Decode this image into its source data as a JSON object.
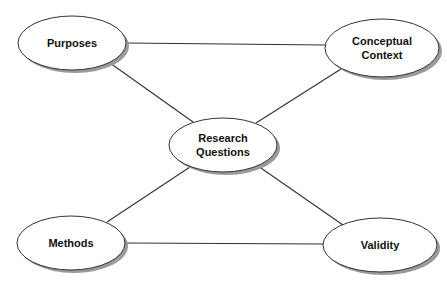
{
  "diagram": {
    "type": "concept-map",
    "colors": {
      "background": "#ffffff",
      "node_fill": "#ffffff",
      "node_stroke": "#333333",
      "shadow": "#9a9a9a",
      "edge": "#333333",
      "text": "#111111"
    },
    "nodes": [
      {
        "id": "purposes",
        "lines": [
          "Purposes"
        ],
        "cx": 72,
        "cy": 43,
        "rx": 54,
        "ry": 27
      },
      {
        "id": "conceptual-context",
        "lines": [
          "Conceptual",
          "Context"
        ],
        "cx": 382,
        "cy": 48,
        "rx": 57,
        "ry": 29
      },
      {
        "id": "research-questions",
        "lines": [
          "Research",
          "Questions"
        ],
        "cx": 223,
        "cy": 145,
        "rx": 54,
        "ry": 27
      },
      {
        "id": "methods",
        "lines": [
          "Methods"
        ],
        "cx": 71,
        "cy": 243,
        "rx": 54,
        "ry": 27
      },
      {
        "id": "validity",
        "lines": [
          "Validity"
        ],
        "cx": 380,
        "cy": 245,
        "rx": 57,
        "ry": 27
      }
    ],
    "edges": [
      {
        "from": "purposes",
        "to": "conceptual-context",
        "x1": 126,
        "y1": 43,
        "x2": 325,
        "y2": 45
      },
      {
        "from": "methods",
        "to": "validity",
        "x1": 125,
        "y1": 243,
        "x2": 323,
        "y2": 244
      },
      {
        "from": "purposes",
        "to": "research-questions",
        "x1": 110,
        "y1": 63,
        "x2": 193,
        "y2": 122
      },
      {
        "from": "conceptual-context",
        "to": "research-questions",
        "x1": 341,
        "y1": 69,
        "x2": 256,
        "y2": 123
      },
      {
        "from": "methods",
        "to": "research-questions",
        "x1": 107,
        "y1": 222,
        "x2": 190,
        "y2": 167
      },
      {
        "from": "validity",
        "to": "research-questions",
        "x1": 343,
        "y1": 225,
        "x2": 258,
        "y2": 166
      }
    ]
  }
}
